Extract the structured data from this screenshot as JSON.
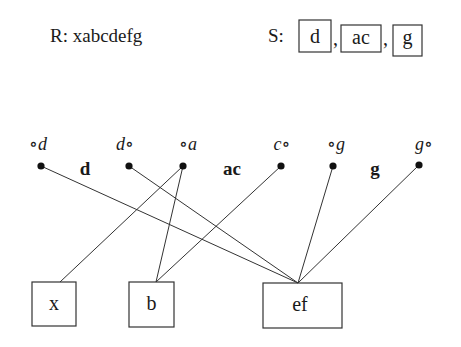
{
  "header": {
    "r_label": "R: xabcdefg",
    "s_prefix": "S:",
    "s_items": [
      "d",
      "ac",
      "g"
    ],
    "separator": ","
  },
  "nodes": [
    {
      "id": "n-d-left",
      "label": "∘d",
      "label_style": "italic"
    },
    {
      "id": "n-d-right",
      "label": "d∘",
      "label_style": "italic"
    },
    {
      "id": "n-a-left",
      "label": "∘a",
      "label_style": "italic"
    },
    {
      "id": "n-c-right",
      "label": "c∘",
      "label_style": "italic"
    },
    {
      "id": "n-g-left",
      "label": "∘g",
      "label_style": "italic"
    },
    {
      "id": "n-g-right",
      "label": "g∘",
      "label_style": "italic"
    }
  ],
  "segment_labels": [
    "d",
    "ac",
    "g"
  ],
  "boxes": [
    {
      "id": "box-x",
      "label": "x"
    },
    {
      "id": "box-b",
      "label": "b"
    },
    {
      "id": "box-ef",
      "label": "ef"
    }
  ],
  "edges": [
    {
      "from": "n-d-left",
      "to": "box-ef"
    },
    {
      "from": "n-d-right",
      "to": "box-ef"
    },
    {
      "from": "n-a-left",
      "to": "box-x"
    },
    {
      "from": "n-a-left",
      "to": "box-b"
    },
    {
      "from": "n-c-right",
      "to": "box-b"
    },
    {
      "from": "n-g-left",
      "to": "box-ef"
    },
    {
      "from": "n-g-right",
      "to": "box-ef"
    }
  ]
}
